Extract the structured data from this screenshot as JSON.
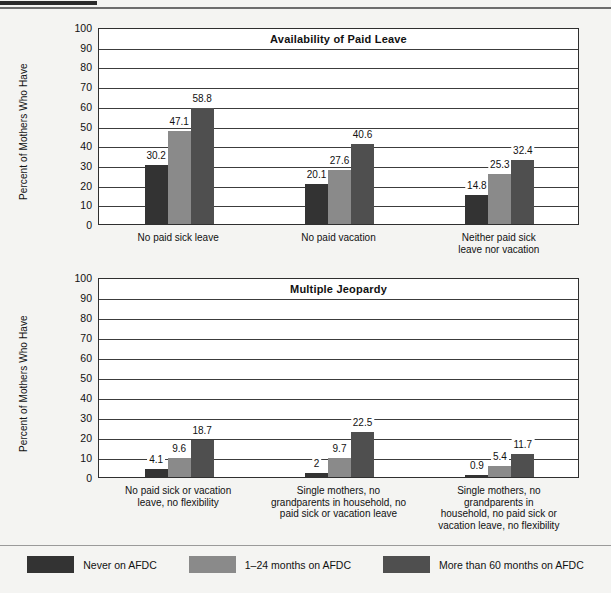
{
  "page": {
    "background_color": "#f4f4f2",
    "top_rule_color": "#6d6d6d"
  },
  "series_colors": [
    "#333333",
    "#8a8a8a",
    "#4f4f4f"
  ],
  "legend": {
    "items": [
      {
        "label": "Never on AFDC",
        "color": "#333333",
        "icon": "legend-swatch-dark"
      },
      {
        "label": "1–24 months on AFDC",
        "color": "#8a8a8a",
        "icon": "legend-swatch-medium"
      },
      {
        "label": "More than 60 months on AFDC",
        "color": "#4f4f4f",
        "icon": "legend-swatch-darkgray"
      }
    ]
  },
  "chart_data": [
    {
      "type": "bar",
      "title": "Availability of Paid Leave",
      "xlabel": "",
      "ylabel": "Percent of Mothers Who Have",
      "ylim": [
        0,
        100
      ],
      "yticks": [
        0,
        10,
        20,
        30,
        40,
        50,
        60,
        70,
        80,
        90,
        100
      ],
      "grid": true,
      "legend_position": "bottom",
      "categories": [
        "No paid sick leave",
        "No paid vacation",
        "Neither paid sick\nleave nor vacation"
      ],
      "series": [
        {
          "name": "Never on AFDC",
          "color": "#333333",
          "values": [
            30.2,
            20.1,
            14.8
          ]
        },
        {
          "name": "1–24 months on AFDC",
          "color": "#8a8a8a",
          "values": [
            47.1,
            27.6,
            25.3
          ]
        },
        {
          "name": "More than 60 months on AFDC",
          "color": "#4f4f4f",
          "values": [
            58.8,
            40.6,
            32.4
          ]
        }
      ]
    },
    {
      "type": "bar",
      "title": "Multiple Jeopardy",
      "xlabel": "",
      "ylabel": "Percent of Mothers Who Have",
      "ylim": [
        0,
        100
      ],
      "yticks": [
        0,
        10,
        20,
        30,
        40,
        50,
        60,
        70,
        80,
        90,
        100
      ],
      "grid": true,
      "legend_position": "bottom",
      "categories": [
        "No paid sick or vacation\nleave, no flexibility",
        "Single mothers, no\ngrandparents in household, no\npaid sick or vacation leave",
        "Single mothers, no\ngrandparents in\nhousehold, no paid sick or\nvacation leave, no flexibility"
      ],
      "series": [
        {
          "name": "Never on AFDC",
          "color": "#333333",
          "values": [
            4.1,
            2.0,
            0.9
          ]
        },
        {
          "name": "1–24 months on AFDC",
          "color": "#8a8a8a",
          "values": [
            9.6,
            9.7,
            5.4
          ]
        },
        {
          "name": "More than 60 months on AFDC",
          "color": "#4f4f4f",
          "values": [
            18.7,
            22.5,
            11.7
          ]
        }
      ]
    }
  ]
}
